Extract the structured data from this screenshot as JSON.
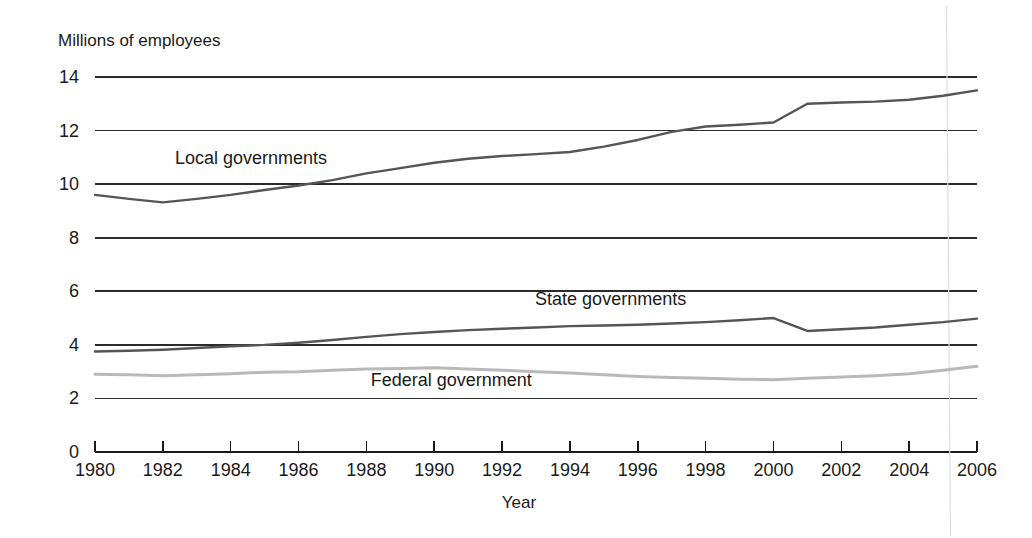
{
  "chart_data": {
    "type": "line",
    "title": "",
    "ylabel": "Millions of employees",
    "xlabel": "Year",
    "xlim": [
      1980,
      2006
    ],
    "ylim": [
      0,
      14
    ],
    "y_ticks": [
      0,
      2,
      4,
      6,
      8,
      10,
      12,
      14
    ],
    "x_ticks": [
      1980,
      1982,
      1984,
      1986,
      1988,
      1990,
      1992,
      1994,
      1996,
      1998,
      2000,
      2002,
      2004,
      2006
    ],
    "grid": "horizontal",
    "legend_position": "inline-labels",
    "x": [
      1980,
      1981,
      1982,
      1983,
      1984,
      1985,
      1986,
      1987,
      1988,
      1989,
      1990,
      1991,
      1992,
      1993,
      1994,
      1995,
      1996,
      1997,
      1998,
      1999,
      2000,
      2001,
      2002,
      2003,
      2004,
      2005,
      2006
    ],
    "series": [
      {
        "name": "Local governments",
        "color": "#555555",
        "label_x": 1984.6,
        "label_y": 10.75,
        "values": [
          9.6,
          9.45,
          9.32,
          9.45,
          9.6,
          9.78,
          9.95,
          10.15,
          10.4,
          10.6,
          10.8,
          10.95,
          11.05,
          11.12,
          11.2,
          11.4,
          11.65,
          11.95,
          12.15,
          12.22,
          12.3,
          13.0,
          13.05,
          13.08,
          13.15,
          13.3,
          13.5
        ]
      },
      {
        "name": "State governments",
        "color": "#555555",
        "label_x": 1995.2,
        "label_y": 5.5,
        "values": [
          3.75,
          3.78,
          3.82,
          3.88,
          3.95,
          4.0,
          4.08,
          4.18,
          4.3,
          4.4,
          4.48,
          4.55,
          4.6,
          4.65,
          4.7,
          4.72,
          4.75,
          4.8,
          4.85,
          4.92,
          5.0,
          4.52,
          4.58,
          4.65,
          4.75,
          4.85,
          4.98
        ]
      },
      {
        "name": "Federal government",
        "color": "#b9b9b9",
        "label_x": 1990.5,
        "label_y": 2.45,
        "values": [
          2.9,
          2.88,
          2.85,
          2.88,
          2.92,
          2.98,
          3.0,
          3.05,
          3.1,
          3.12,
          3.15,
          3.1,
          3.05,
          3.0,
          2.95,
          2.88,
          2.82,
          2.78,
          2.75,
          2.72,
          2.7,
          2.75,
          2.8,
          2.85,
          2.92,
          3.05,
          3.2
        ]
      }
    ]
  }
}
